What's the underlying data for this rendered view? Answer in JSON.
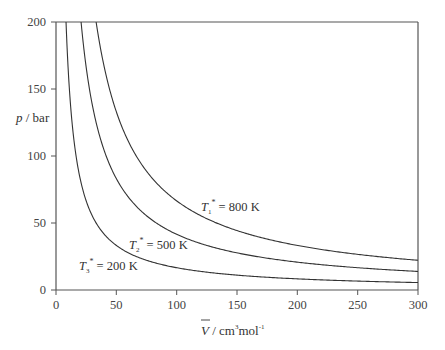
{
  "chart_data": {
    "type": "line",
    "title": "",
    "xlabel": "V̄ / cm³mol⁻¹",
    "ylabel": "p / bar",
    "xlim": [
      0,
      300
    ],
    "ylim": [
      0,
      200
    ],
    "x_ticks": [
      0,
      50,
      100,
      150,
      200,
      250,
      300
    ],
    "y_ticks": [
      0,
      50,
      100,
      150,
      200
    ],
    "grid": false,
    "legend": "inline labels",
    "x": [
      10,
      20,
      30,
      40,
      50,
      75,
      100,
      150,
      200,
      250,
      300
    ],
    "series": [
      {
        "name": "T1* = 800 K",
        "T": 800,
        "values": [
          null,
          null,
          null,
          166.3,
          133.0,
          88.7,
          66.5,
          44.3,
          33.3,
          26.6,
          22.2
        ]
      },
      {
        "name": "T2* = 500 K",
        "T": 500,
        "values": [
          null,
          null,
          138.6,
          103.9,
          83.1,
          55.4,
          41.6,
          27.7,
          20.8,
          16.6,
          13.9
        ]
      },
      {
        "name": "T3* = 200 K",
        "T": 200,
        "values": [
          166.3,
          83.1,
          55.4,
          41.6,
          33.3,
          22.2,
          16.6,
          11.1,
          8.3,
          6.7,
          5.5
        ]
      }
    ],
    "model": "p = R·T / V (R = 8.314)"
  },
  "axes": {
    "x_tick_labels": [
      "0",
      "50",
      "100",
      "150",
      "200",
      "250",
      "300"
    ],
    "y_tick_labels": [
      "0",
      "50",
      "100",
      "150",
      "200"
    ],
    "x_label": {
      "symbol": "V",
      "rest": " / cm",
      "sup1": "3",
      "mid": "mol",
      "sup2": "-1"
    },
    "y_label": {
      "symbol": "p",
      "rest": " / bar"
    }
  },
  "labels": [
    {
      "symbol": "T",
      "sub": "1",
      "sup": "*",
      "text": " = 800 K"
    },
    {
      "symbol": "T",
      "sub": "2",
      "sup": "*",
      "text": " = 500 K"
    },
    {
      "symbol": "T",
      "sub": "3",
      "sup": "*",
      "text": " = 200 K"
    }
  ]
}
